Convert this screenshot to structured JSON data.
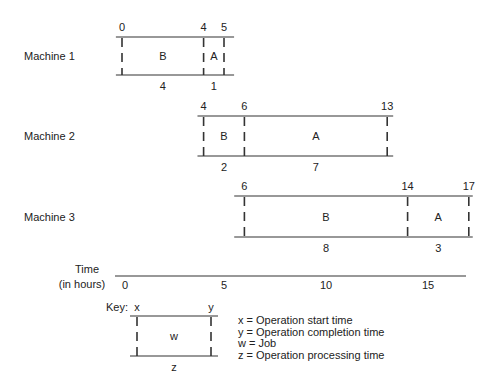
{
  "scale": {
    "origin_x": 122,
    "px_per_hour": 20.4
  },
  "machines": [
    {
      "label": "Machine 1",
      "label_x": 24,
      "label_y": 60,
      "top_y": 37,
      "bottom_y": 75,
      "line_from": -0.3,
      "line_to": 5.2,
      "boundaries": [
        0,
        4,
        5
      ],
      "jobs": [
        {
          "job": "B",
          "start": 0,
          "end": 4,
          "duration": "4"
        },
        {
          "job": "A",
          "start": 4,
          "end": 5,
          "duration": "1"
        }
      ]
    },
    {
      "label": "Machine 2",
      "label_x": 24,
      "label_y": 140,
      "top_y": 116,
      "bottom_y": 156,
      "line_from": 3.7,
      "line_to": 13.0,
      "boundaries": [
        4,
        6,
        13
      ],
      "jobs": [
        {
          "job": "B",
          "start": 4,
          "end": 6,
          "duration": "2"
        },
        {
          "job": "A",
          "start": 6,
          "end": 13,
          "duration": "7"
        }
      ]
    },
    {
      "label": "Machine 3",
      "label_x": 24,
      "label_y": 221,
      "top_y": 196,
      "bottom_y": 237,
      "line_from": 5.5,
      "line_to": 16.9,
      "boundaries": [
        6,
        14,
        17
      ],
      "jobs": [
        {
          "job": "B",
          "start": 6,
          "end": 14,
          "duration": "8"
        },
        {
          "job": "A",
          "start": 14,
          "end": 17,
          "duration": "3"
        }
      ]
    }
  ],
  "time_axis": {
    "label_line1": "Time",
    "label_line2": "(in hours)",
    "y": 276,
    "line_from_x": 115,
    "line_to_x": 466,
    "ticks": [
      0,
      5,
      10,
      15
    ]
  },
  "key": {
    "title": "Key:",
    "start_symbol": "x",
    "end_symbol": "y",
    "job_symbol": "w",
    "duration_symbol": "z",
    "legend": [
      "x = Operation start time",
      "y = Operation completion time",
      "w = Job",
      "z = Operation processing time"
    ]
  },
  "colors": {
    "line": "#333333",
    "text": "#222222",
    "background": "#ffffff"
  }
}
